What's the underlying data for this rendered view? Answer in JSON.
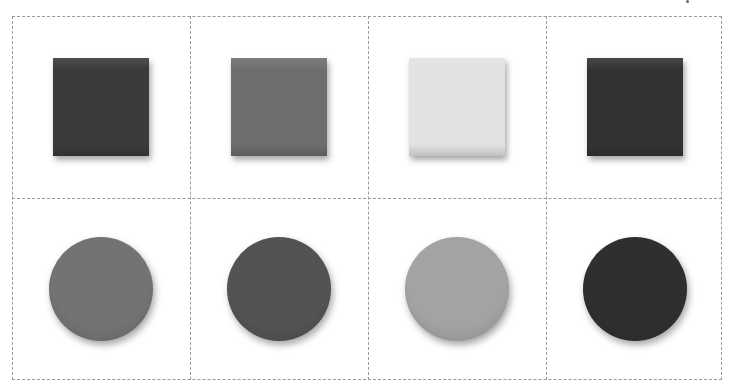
{
  "grid": {
    "columns": 4,
    "rows": 2,
    "border_color": "#9a9a9a",
    "border_style": "dashed"
  },
  "rows": [
    {
      "shape": "square",
      "items": [
        {
          "color": "#3a3a3a"
        },
        {
          "color": "#6e6e6e"
        },
        {
          "color": "#e2e2e2"
        },
        {
          "color": "#333333"
        }
      ]
    },
    {
      "shape": "circle",
      "items": [
        {
          "color": "#737373"
        },
        {
          "color": "#535353"
        },
        {
          "color": "#a3a3a3"
        },
        {
          "color": "#2f2f2f"
        }
      ]
    }
  ]
}
